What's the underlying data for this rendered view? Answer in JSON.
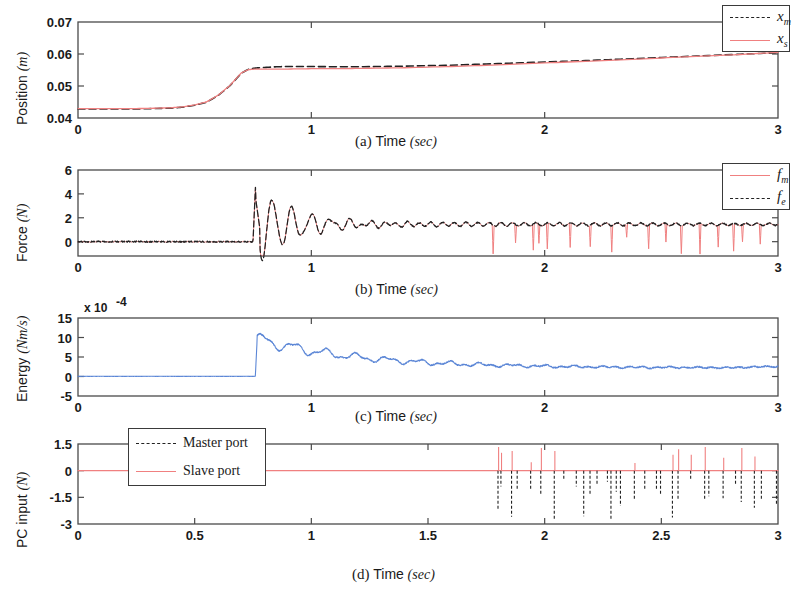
{
  "figure": {
    "panel_a": {
      "caption_label": "(a)",
      "caption_axis": "Time",
      "caption_unit": "(sec)",
      "ylabel_main": "Position",
      "ylabel_unit": "(m)",
      "legend": [
        {
          "name": "x_m",
          "base": "x",
          "sub": "m",
          "style": "dashed",
          "color": "#222222"
        },
        {
          "name": "x_s",
          "base": "x",
          "sub": "s",
          "style": "solid",
          "color": "#f08080"
        }
      ]
    },
    "panel_b": {
      "caption_label": "(b)",
      "caption_axis": "Time",
      "caption_unit": "(sec)",
      "ylabel_main": "Force",
      "ylabel_unit": "(N)",
      "legend": [
        {
          "name": "f_m",
          "base": "f",
          "sub": "m",
          "style": "solid",
          "color": "#f08080"
        },
        {
          "name": "f_e",
          "base": "f",
          "sub": "e",
          "style": "dashed",
          "color": "#222222"
        }
      ]
    },
    "panel_c": {
      "caption_label": "(c)",
      "caption_axis": "Time",
      "caption_unit": "(sec)",
      "ylabel_main": "Energy",
      "ylabel_unit": "(Nm/s)",
      "multiplier": "x 10",
      "multiplier_exp": "-4"
    },
    "panel_d": {
      "caption_label": "(d)",
      "caption_axis": "Time",
      "caption_unit": "(sec)",
      "ylabel_main": "PC input",
      "ylabel_unit": "(N)",
      "legend": [
        {
          "label": "Master port",
          "style": "dashed",
          "color": "#222222"
        },
        {
          "label": "Slave port",
          "style": "solid",
          "color": "#f08080"
        }
      ]
    }
  },
  "colors": {
    "master_dashed": "#222222",
    "slave_red": "#f08080",
    "energy_blue": "#5b86d6",
    "axis": "#4a4a4a"
  },
  "chart_data": [
    {
      "id": "a",
      "type": "line",
      "title": "(a) Position vs Time",
      "xlabel": "Time (sec)",
      "ylabel": "Position (m)",
      "xlim": [
        0,
        3
      ],
      "ylim": [
        0.04,
        0.07
      ],
      "xticks": [
        0,
        1,
        2,
        3
      ],
      "xticklabels": [
        "0",
        "1",
        "2",
        "3"
      ],
      "yticks": [
        0.04,
        0.05,
        0.06,
        0.07
      ],
      "yticklabels": [
        "0.04",
        "0.05",
        "0.06",
        "0.07"
      ],
      "grid": false,
      "legend_position": "top-right",
      "series": [
        {
          "name": "x_m",
          "style": "dashed",
          "color": "#222222",
          "x": [
            0,
            0.1,
            0.2,
            0.3,
            0.4,
            0.45,
            0.5,
            0.55,
            0.6,
            0.65,
            0.7,
            0.73,
            0.76,
            0.8,
            0.85,
            0.9,
            1.0,
            1.1,
            1.2,
            1.4,
            1.6,
            1.8,
            2.0,
            2.2,
            2.4,
            2.6,
            2.8,
            2.9,
            3.0
          ],
          "values": [
            0.0428,
            0.0428,
            0.0428,
            0.0429,
            0.0431,
            0.0434,
            0.044,
            0.0449,
            0.047,
            0.05,
            0.054,
            0.0552,
            0.0556,
            0.0558,
            0.056,
            0.0561,
            0.0561,
            0.056,
            0.056,
            0.0562,
            0.0565,
            0.057,
            0.0575,
            0.058,
            0.0586,
            0.0592,
            0.0598,
            0.0601,
            0.0604
          ]
        },
        {
          "name": "x_s",
          "style": "solid",
          "color": "#f08080",
          "x": [
            0,
            0.1,
            0.2,
            0.3,
            0.4,
            0.45,
            0.5,
            0.55,
            0.6,
            0.65,
            0.7,
            0.73,
            0.76,
            0.8,
            0.85,
            0.9,
            1.0,
            1.1,
            1.2,
            1.4,
            1.6,
            1.8,
            2.0,
            2.2,
            2.4,
            2.6,
            2.8,
            2.9,
            3.0
          ],
          "values": [
            0.0429,
            0.0429,
            0.0429,
            0.043,
            0.0432,
            0.0435,
            0.0441,
            0.045,
            0.0471,
            0.0501,
            0.0541,
            0.0551,
            0.0553,
            0.0553,
            0.0553,
            0.0553,
            0.0554,
            0.0554,
            0.0555,
            0.0557,
            0.0561,
            0.0566,
            0.0572,
            0.0578,
            0.0584,
            0.0591,
            0.0597,
            0.0601,
            0.0605
          ]
        }
      ]
    },
    {
      "id": "b",
      "type": "line",
      "title": "(b) Force vs Time",
      "xlabel": "Time (sec)",
      "ylabel": "Force (N)",
      "xlim": [
        0,
        3
      ],
      "ylim": [
        -1.2,
        6
      ],
      "xticks": [
        0,
        1,
        2,
        3
      ],
      "xticklabels": [
        "0",
        "1",
        "2",
        "3"
      ],
      "yticks": [
        0,
        2,
        4,
        6
      ],
      "yticklabels": [
        "0",
        "2",
        "4",
        "6"
      ],
      "grid": false,
      "legend_position": "top-right",
      "contact_time": 0.75,
      "peak_force": 5.2,
      "steady_force": 1.45,
      "spike_onset": 1.78,
      "series": [
        {
          "name": "f_m",
          "style": "solid",
          "color": "#f08080"
        },
        {
          "name": "f_e",
          "style": "dashed",
          "color": "#222222"
        }
      ]
    },
    {
      "id": "c",
      "type": "line",
      "title": "(c) Energy vs Time",
      "xlabel": "Time (sec)",
      "ylabel": "Energy (Nm/s)",
      "y_multiplier": "x 10^-4",
      "xlim": [
        0,
        3
      ],
      "ylim": [
        -5,
        15
      ],
      "xticks": [
        0,
        1,
        2,
        3
      ],
      "xticklabels": [
        "0",
        "1",
        "2",
        "3"
      ],
      "yticks": [
        -5,
        0,
        5,
        10,
        15
      ],
      "yticklabels": [
        "-5",
        "0",
        "5",
        "10",
        "15"
      ],
      "grid": false,
      "onset_time": 0.76,
      "peak_value": 9.8,
      "settle_value": 2.2,
      "series": [
        {
          "name": "energy",
          "style": "solid",
          "color": "#5b86d6"
        }
      ]
    },
    {
      "id": "d",
      "type": "line",
      "title": "(d) PC input vs Time",
      "xlabel": "Time (sec)",
      "ylabel": "PC input (N)",
      "xlim": [
        0,
        3
      ],
      "ylim": [
        -3,
        1.5
      ],
      "xticks": [
        0,
        0.5,
        1,
        1.5,
        2,
        2.5,
        3
      ],
      "xticklabels": [
        "0",
        "0.5",
        "1",
        "1.5",
        "2",
        "2.5",
        "3"
      ],
      "yticks": [
        -3,
        -1.5,
        0,
        1.5
      ],
      "yticklabels": [
        "-3",
        "-1.5",
        "0",
        "1.5"
      ],
      "grid": false,
      "legend_position": "top-left",
      "spike_onset": 1.8,
      "series": [
        {
          "name": "Master port",
          "style": "dashed",
          "color": "#222222"
        },
        {
          "name": "Slave port",
          "style": "solid",
          "color": "#f08080"
        }
      ]
    }
  ]
}
